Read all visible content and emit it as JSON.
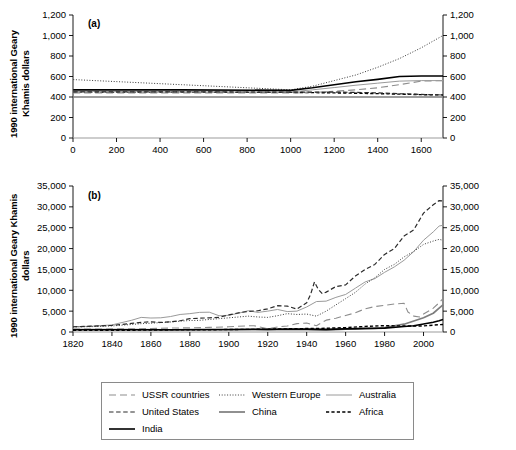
{
  "figure": {
    "y_axis_label": "1990 international Geary Khamis dollars",
    "panel_a_tag": "(a)",
    "panel_b_tag": "(b)"
  },
  "legend": {
    "items": [
      {
        "label": "USSR countries",
        "style": "long-dash",
        "color": "#8d8d8d",
        "width": 1.1
      },
      {
        "label": "Western Europe",
        "style": "dotted",
        "color": "#3a3a3a",
        "width": 1.0
      },
      {
        "label": "Australia",
        "style": "solid",
        "color": "#9a9a9a",
        "width": 1.0
      },
      {
        "label": "United States",
        "style": "dash",
        "color": "#2b2b2b",
        "width": 1.2
      },
      {
        "label": "China",
        "style": "solid",
        "color": "#7d7d7d",
        "width": 1.7
      },
      {
        "label": "Africa",
        "style": "short-dash",
        "color": "#000000",
        "width": 1.4
      },
      {
        "label": "India",
        "style": "solid",
        "color": "#000000",
        "width": 1.6
      }
    ]
  },
  "chart_data": [
    {
      "type": "line",
      "panel": "(a)",
      "title": "",
      "xlabel": "",
      "ylabel": "1990 international Geary Khamis dollars",
      "xlim": [
        0,
        1700
      ],
      "ylim": [
        0,
        1200
      ],
      "xticks": [
        0,
        200,
        400,
        600,
        800,
        1000,
        1200,
        1400,
        1600
      ],
      "xticklabels": [
        "0",
        "200",
        "400",
        "600",
        "800",
        "1000",
        "1200",
        "1400",
        "1600"
      ],
      "yticks": [
        0,
        200,
        400,
        600,
        800,
        1000,
        1200
      ],
      "yticklabels": [
        "0",
        "200",
        "400",
        "600",
        "800",
        "1,000",
        "1,200"
      ],
      "right_axis": true,
      "grid": false,
      "legend_position": "below-figure",
      "series": [
        {
          "name": "Western Europe",
          "x": [
            1,
            500,
            1000,
            1100,
            1200,
            1300,
            1400,
            1500,
            1600,
            1700
          ],
          "values": [
            570,
            520,
            470,
            505,
            560,
            615,
            690,
            775,
            880,
            1000
          ]
        },
        {
          "name": "India",
          "x": [
            1,
            500,
            1000,
            1100,
            1200,
            1300,
            1400,
            1500,
            1600,
            1700
          ],
          "values": [
            470,
            470,
            465,
            490,
            520,
            548,
            572,
            600,
            605,
            605
          ]
        },
        {
          "name": "Australia",
          "x": [
            1,
            500,
            1000,
            1100,
            1200,
            1300,
            1400,
            1500,
            1600,
            1700
          ],
          "values": [
            455,
            450,
            450,
            470,
            492,
            515,
            535,
            555,
            560,
            560
          ]
        },
        {
          "name": "USSR countries",
          "x": [
            1,
            500,
            1000,
            1100,
            1200,
            1300,
            1400,
            1500,
            1600,
            1700
          ],
          "values": [
            440,
            440,
            440,
            445,
            455,
            470,
            490,
            520,
            555,
            560
          ]
        },
        {
          "name": "United States",
          "x": [
            1,
            500,
            1000,
            1100,
            1200,
            1300,
            1400,
            1500,
            1600,
            1700
          ],
          "values": [
            450,
            450,
            448,
            448,
            448,
            445,
            440,
            432,
            425,
            420
          ]
        },
        {
          "name": "Africa",
          "x": [
            1,
            500,
            1000,
            1100,
            1200,
            1300,
            1400,
            1500,
            1600,
            1700
          ],
          "values": [
            450,
            448,
            445,
            443,
            440,
            437,
            433,
            428,
            423,
            420
          ]
        },
        {
          "name": "China",
          "x": [
            1,
            500,
            1000,
            1100,
            1200,
            1300,
            1400,
            1500,
            1600,
            1700
          ],
          "values": [
            400,
            400,
            400,
            400,
            400,
            400,
            400,
            400,
            400,
            400
          ]
        }
      ]
    },
    {
      "type": "line",
      "panel": "(b)",
      "title": "",
      "xlabel": "",
      "ylabel": "1990 international Geary Khamis dollars",
      "xlim": [
        1820,
        2010
      ],
      "ylim": [
        0,
        35000
      ],
      "xticks": [
        1820,
        1840,
        1860,
        1880,
        1900,
        1920,
        1940,
        1960,
        1980,
        2000
      ],
      "xticklabels": [
        "1820",
        "1840",
        "1860",
        "1880",
        "1900",
        "1920",
        "1940",
        "1960",
        "1980",
        "2000"
      ],
      "yticks": [
        0,
        5000,
        10000,
        15000,
        20000,
        25000,
        30000,
        35000
      ],
      "yticklabels": [
        "0",
        "5,000",
        "10,000",
        "15,000",
        "20,000",
        "25,000",
        "30,000",
        "35,000"
      ],
      "right_axis": true,
      "grid": false,
      "legend_position": "below-figure",
      "series": [
        {
          "name": "United States",
          "x": [
            1820,
            1830,
            1840,
            1850,
            1855,
            1860,
            1865,
            1870,
            1875,
            1880,
            1885,
            1890,
            1895,
            1900,
            1905,
            1910,
            1915,
            1920,
            1925,
            1930,
            1935,
            1940,
            1942,
            1944,
            1946,
            1948,
            1950,
            1955,
            1960,
            1965,
            1970,
            1975,
            1980,
            1985,
            1990,
            1995,
            2000,
            2005,
            2008,
            2010
          ],
          "values": [
            1260,
            1400,
            1600,
            2050,
            2300,
            2450,
            2300,
            2450,
            2700,
            3200,
            3300,
            3400,
            3500,
            4100,
            4600,
            4950,
            5100,
            5550,
            6300,
            6200,
            5500,
            7000,
            9000,
            12000,
            10200,
            9200,
            9560,
            10900,
            11300,
            13400,
            15000,
            16200,
            18600,
            20000,
            23000,
            24500,
            28500,
            30500,
            31500,
            31400
          ]
        },
        {
          "name": "Australia",
          "x": [
            1820,
            1830,
            1840,
            1850,
            1855,
            1860,
            1865,
            1870,
            1875,
            1880,
            1885,
            1890,
            1895,
            1900,
            1905,
            1910,
            1915,
            1920,
            1925,
            1930,
            1935,
            1940,
            1945,
            1950,
            1955,
            1960,
            1965,
            1970,
            1975,
            1980,
            1985,
            1990,
            1995,
            2000,
            2005,
            2008,
            2010
          ],
          "values": [
            1250,
            1400,
            1700,
            2800,
            3500,
            3350,
            3400,
            3700,
            4200,
            4400,
            4700,
            4750,
            3900,
            4000,
            4500,
            5100,
            4700,
            5000,
            5400,
            4900,
            5000,
            6000,
            7300,
            7400,
            8300,
            9000,
            10500,
            12000,
            12800,
            14300,
            15600,
            17200,
            19300,
            22000,
            24000,
            25400,
            25600
          ]
        },
        {
          "name": "Western Europe",
          "x": [
            1820,
            1830,
            1840,
            1850,
            1855,
            1860,
            1865,
            1870,
            1875,
            1880,
            1885,
            1890,
            1895,
            1900,
            1905,
            1910,
            1915,
            1920,
            1925,
            1930,
            1935,
            1940,
            1945,
            1950,
            1955,
            1960,
            1965,
            1970,
            1975,
            1980,
            1985,
            1990,
            1995,
            2000,
            2005,
            2008,
            2010
          ],
          "values": [
            1200,
            1300,
            1450,
            1800,
            2000,
            2100,
            2250,
            2400,
            2600,
            2750,
            2800,
            3000,
            3200,
            3400,
            3600,
            3800,
            3600,
            3500,
            3900,
            4400,
            4200,
            4300,
            3800,
            5000,
            6500,
            8000,
            9500,
            11500,
            13000,
            15000,
            16200,
            18000,
            19300,
            21000,
            21800,
            22200,
            22000
          ]
        },
        {
          "name": "USSR countries",
          "x": [
            1820,
            1840,
            1860,
            1870,
            1880,
            1890,
            1900,
            1910,
            1913,
            1920,
            1925,
            1930,
            1935,
            1940,
            1945,
            1950,
            1955,
            1960,
            1965,
            1970,
            1975,
            1980,
            1985,
            1990,
            1992,
            1995,
            1998,
            2000,
            2005,
            2008,
            2010
          ],
          "values": [
            690,
            740,
            820,
            940,
            1000,
            1100,
            1250,
            1490,
            1490,
            800,
            1200,
            1450,
            2000,
            2150,
            1500,
            2840,
            3300,
            3950,
            4600,
            5570,
            6100,
            6400,
            6700,
            6900,
            4800,
            3800,
            3600,
            4300,
            5700,
            7000,
            8000
          ]
        },
        {
          "name": "China",
          "x": [
            1820,
            1850,
            1870,
            1890,
            1900,
            1913,
            1920,
            1930,
            1940,
            1950,
            1955,
            1960,
            1965,
            1970,
            1975,
            1980,
            1985,
            1990,
            1995,
            2000,
            2005,
            2008,
            2010
          ],
          "values": [
            600,
            600,
            530,
            540,
            545,
            552,
            570,
            570,
            560,
            448,
            575,
            660,
            700,
            780,
            870,
            1060,
            1500,
            1870,
            2650,
            3420,
            4500,
            5700,
            6500
          ]
        },
        {
          "name": "India",
          "x": [
            1820,
            1850,
            1870,
            1890,
            1900,
            1913,
            1920,
            1930,
            1940,
            1950,
            1960,
            1970,
            1980,
            1990,
            1995,
            2000,
            2005,
            2008,
            2010
          ],
          "values": [
            533,
            533,
            533,
            584,
            599,
            673,
            635,
            726,
            686,
            619,
            753,
            868,
            938,
            1309,
            1500,
            1900,
            2350,
            2700,
            3000
          ]
        },
        {
          "name": "Africa",
          "x": [
            1820,
            1850,
            1870,
            1890,
            1900,
            1913,
            1920,
            1930,
            1940,
            1950,
            1960,
            1970,
            1980,
            1990,
            2000,
            2008,
            2010
          ],
          "values": [
            420,
            430,
            500,
            530,
            600,
            640,
            700,
            760,
            830,
            890,
            1060,
            1340,
            1520,
            1440,
            1450,
            1750,
            1800
          ]
        }
      ]
    }
  ]
}
